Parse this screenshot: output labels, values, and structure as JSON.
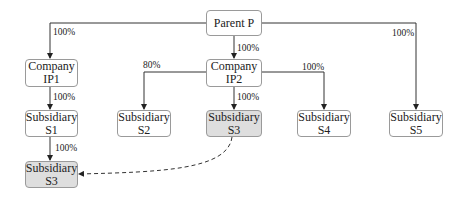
{
  "diagram": {
    "nodes": {
      "parent": {
        "line1": "Parent P",
        "line2": ""
      },
      "ip1": {
        "line1": "Company",
        "line2": "IP1"
      },
      "ip2": {
        "line1": "Company",
        "line2": "IP2"
      },
      "s1": {
        "line1": "Subsidiary",
        "line2": "S1"
      },
      "s2": {
        "line1": "Subsidiary",
        "line2": "S2"
      },
      "s3_mid": {
        "line1": "Subsidiary",
        "line2": "S3"
      },
      "s4": {
        "line1": "Subsidiary",
        "line2": "S4"
      },
      "s5": {
        "line1": "Subsidiary",
        "line2": "S5"
      },
      "s3_bottom": {
        "line1": "Subsidiary",
        "line2": "S3"
      }
    },
    "edges": {
      "parent_ip1": "100%",
      "parent_ip2": "100%",
      "parent_s5": "100%",
      "ip1_s1": "100%",
      "ip2_s2": "80%",
      "ip2_s3": "100%",
      "ip2_s4": "100%",
      "s1_s3": "100%"
    },
    "colors": {
      "highlight_fill": "#dedede",
      "box_fill": "#ffffff",
      "box_border": "#9a9a9a",
      "line": "#333333"
    }
  }
}
